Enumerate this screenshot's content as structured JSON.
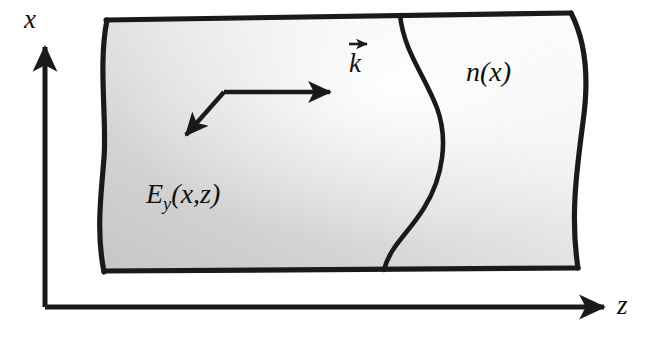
{
  "figure": {
    "background_color": "#ffffff",
    "ink_color": "#1a1a1a",
    "slab_fill_light": "#f2f2f2",
    "slab_fill_mid": "#d8d8d8",
    "slab_fill_dark": "#c2c2c2"
  },
  "axes": {
    "vertical": {
      "name": "x-axis",
      "label": "x",
      "direction": "up"
    },
    "horizontal": {
      "name": "z-axis",
      "label": "z",
      "direction": "right"
    },
    "origin_corner": "bottom-left"
  },
  "labels": {
    "field": {
      "base": "E",
      "subscript": "y",
      "arguments": "(x,z)",
      "full": "Ey(x,z)"
    },
    "index_profile": {
      "full": "n(x)"
    },
    "wavevector": {
      "base": "k",
      "full": "k",
      "has_vector_arrow": true
    }
  },
  "annotations": {
    "ray": {
      "name": "zigzag-ray",
      "description": "bouncing ray path with two arrowheads"
    },
    "profile_curve": {
      "name": "index-profile-curve",
      "description": "S-shaped curve showing n(x) variation across the slab"
    }
  }
}
